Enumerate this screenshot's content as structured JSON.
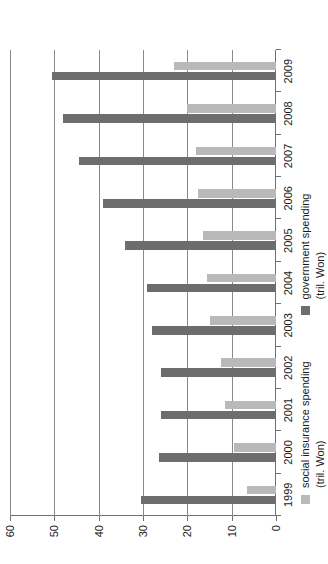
{
  "chart_data": {
    "type": "bar",
    "orientation": "rotated-90-ccw",
    "title": "",
    "xlabel": "",
    "ylabel": "",
    "ylim": [
      0,
      60
    ],
    "yticks": [
      0,
      10,
      20,
      30,
      40,
      50,
      60
    ],
    "ytick_labels": [
      "0",
      "10",
      "20",
      "30",
      "40",
      "50",
      "60"
    ],
    "grid": true,
    "legend_position": "right",
    "categories": [
      "1999",
      "2000",
      "2001",
      "2002",
      "2003",
      "2004",
      "2005",
      "2006",
      "2007",
      "2008",
      "2009"
    ],
    "series": [
      {
        "name": "social insurance spending",
        "unit": "(tril. Won)",
        "color": "#b9b9b9",
        "values": [
          6.5,
          9.5,
          11.5,
          12.5,
          15.0,
          15.5,
          16.5,
          17.5,
          18.0,
          20.0,
          23.0
        ]
      },
      {
        "name": "government spending",
        "unit": "(tril. Won)",
        "color": "#6d6d6d",
        "values": [
          30.5,
          26.5,
          26.0,
          26.0,
          28.0,
          29.0,
          34.0,
          39.0,
          44.5,
          48.0,
          50.5
        ]
      }
    ]
  },
  "legend": {
    "items": [
      {
        "label_line1": "social insurance spending",
        "label_line2": "(tril. Won)",
        "swatch": "soc",
        "swatch_name": "legend-swatch-social-insurance"
      },
      {
        "label_line1": "government spending",
        "label_line2": "(tril. Won)",
        "swatch": "gov",
        "swatch_name": "legend-swatch-government"
      }
    ]
  }
}
